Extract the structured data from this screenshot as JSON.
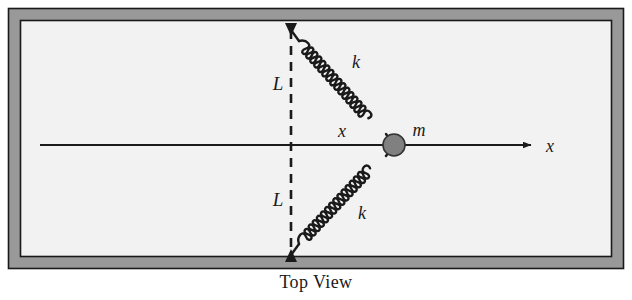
{
  "figure": {
    "caption": "Top View",
    "labels": {
      "spring_top": "k",
      "spring_bottom": "k",
      "length_top": "L",
      "length_bottom": "L",
      "mass": "m",
      "displacement": "x",
      "axis": "x"
    }
  },
  "colors": {
    "frame_band": "#999999",
    "frame_line": "#1a1a1a",
    "interior": "#f2f2f2",
    "ink": "#1a1a1a",
    "mass_fill": "#808080",
    "mass_stroke": "#333333",
    "page": "#ffffff"
  },
  "geometry": {
    "outer_frame": {
      "x": 8,
      "y": 8,
      "width": 616,
      "height": 261
    },
    "band_width": 12,
    "interior": {
      "x": 21,
      "y": 21,
      "width": 590,
      "height": 235
    },
    "dashed_line": {
      "x": 291,
      "y_top": 30,
      "y_bottom": 255
    },
    "axis": {
      "x_start": 40,
      "x_end": 538,
      "y": 145
    },
    "mass": {
      "cx": 394,
      "cy": 145,
      "r": 11
    },
    "spring_top": {
      "x1": 291,
      "y1": 30,
      "x2": 394,
      "y2": 145,
      "coils": 16
    },
    "spring_bottom": {
      "x1": 291,
      "y1": 255,
      "x2": 394,
      "y2": 145,
      "coils": 16
    },
    "anchor_top": {
      "x": 291,
      "y": 30
    },
    "anchor_bottom": {
      "x": 291,
      "y": 255
    }
  },
  "label_positions": {
    "length_top": {
      "x": 278,
      "y": 90
    },
    "length_bottom": {
      "x": 278,
      "y": 206
    },
    "spring_top": {
      "x": 356,
      "y": 68
    },
    "spring_bottom": {
      "x": 362,
      "y": 219
    },
    "mass": {
      "x": 419,
      "y": 136
    },
    "displacement": {
      "x": 342,
      "y": 137
    },
    "axis": {
      "x": 550,
      "y": 152
    }
  }
}
